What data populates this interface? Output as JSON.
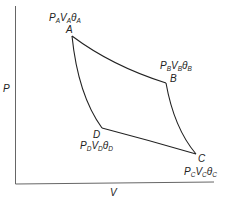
{
  "diagram": {
    "type": "P-V cycle diagram",
    "axes": {
      "y_label": "P",
      "x_label": "V"
    },
    "points": [
      {
        "id": "A",
        "label": "A",
        "state": {
          "p": "P",
          "p_sub": "A",
          "v": "V",
          "v_sub": "A",
          "t": "θ",
          "t_sub": "A"
        }
      },
      {
        "id": "B",
        "label": "B",
        "state": {
          "p": "P",
          "p_sub": "B",
          "v": "V",
          "v_sub": "B",
          "t": "θ",
          "t_sub": "B"
        }
      },
      {
        "id": "C",
        "label": "C",
        "state": {
          "p": "P",
          "p_sub": "C",
          "v": "V",
          "v_sub": "C",
          "t": "θ",
          "t_sub": "C"
        }
      },
      {
        "id": "D",
        "label": "D",
        "state": {
          "p": "P",
          "p_sub": "D",
          "v": "V",
          "v_sub": "D",
          "t": "θ",
          "t_sub": "D"
        }
      }
    ],
    "curves": [
      {
        "from": "A",
        "to": "B"
      },
      {
        "from": "B",
        "to": "C"
      },
      {
        "from": "C",
        "to": "D"
      },
      {
        "from": "D",
        "to": "A"
      }
    ],
    "colors": {
      "line": "#222222",
      "axis": "#555555"
    }
  }
}
